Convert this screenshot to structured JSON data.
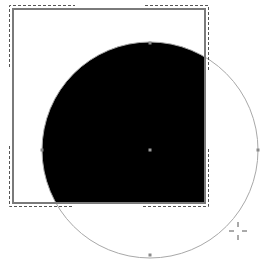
{
  "canvas": {
    "width": 268,
    "height": 264,
    "background": "#ffffff"
  },
  "clip_rect": {
    "x": 13,
    "y": 9,
    "width": 192,
    "height": 194,
    "stroke": "#7a7a7a",
    "stroke_width": 2
  },
  "selection_marks": {
    "stroke": "#555555",
    "dash": "3,2",
    "offset": 4,
    "corners": [
      {
        "name": "top-left",
        "h_len": 65,
        "v_len": 62
      },
      {
        "name": "top-right",
        "h_len": 62,
        "v_len": 62
      },
      {
        "name": "bottom-left",
        "h_len": 62,
        "v_len": 58
      },
      {
        "name": "bottom-right",
        "h_len": 62,
        "v_len": 58
      }
    ]
  },
  "circle": {
    "cx": 150,
    "cy": 150,
    "r": 108,
    "stroke": "#a8a8a8",
    "fill": "#000000"
  },
  "anchor_points": [
    {
      "name": "top",
      "x": 150,
      "y": 43
    },
    {
      "name": "left",
      "x": 42,
      "y": 150
    },
    {
      "name": "right",
      "x": 258,
      "y": 150
    },
    {
      "name": "bottom",
      "x": 150,
      "y": 255
    },
    {
      "name": "center",
      "x": 150,
      "y": 150
    }
  ],
  "cursor": {
    "type": "crosshair",
    "x": 238,
    "y": 231,
    "color": "#555555"
  }
}
